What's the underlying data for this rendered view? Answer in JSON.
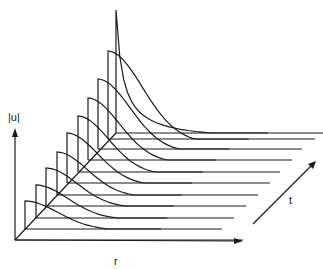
{
  "figure": {
    "type": "waterfall-3d-plot",
    "axes": {
      "vertical_label": "|u|",
      "horizontal_label": "r",
      "depth_label": "t"
    },
    "colors": {
      "line": "#1a1a1a",
      "background": "#ffffff"
    },
    "origin": [
      15,
      240
    ],
    "r_axis_end": [
      243,
      241
    ],
    "u_axis_top": [
      15,
      128
    ],
    "t_arrow": {
      "from": [
        253,
        224
      ],
      "to": [
        316,
        161
      ]
    },
    "slices": [
      {
        "x0": 15,
        "y0": 240,
        "xEnd": 243,
        "height": 0,
        "width": 0
      },
      {
        "x0": 25,
        "y0": 229,
        "xEnd": 222,
        "height": 28,
        "width": 85
      },
      {
        "x0": 36,
        "y0": 218,
        "xEnd": 234,
        "height": 33,
        "width": 82
      },
      {
        "x0": 46,
        "y0": 206,
        "xEnd": 246,
        "height": 38,
        "width": 80
      },
      {
        "x0": 57,
        "y0": 195,
        "xEnd": 258,
        "height": 43,
        "width": 78
      },
      {
        "x0": 67,
        "y0": 183,
        "xEnd": 270,
        "height": 50,
        "width": 78
      },
      {
        "x0": 78,
        "y0": 172,
        "xEnd": 280,
        "height": 56,
        "width": 78
      },
      {
        "x0": 88,
        "y0": 160,
        "xEnd": 292,
        "height": 62,
        "width": 80
      },
      {
        "x0": 98,
        "y0": 149,
        "xEnd": 302,
        "height": 70,
        "width": 82
      },
      {
        "x0": 108,
        "y0": 139,
        "xEnd": 315,
        "height": 88,
        "width": 88
      },
      {
        "x0": 116,
        "y0": 133,
        "xEnd": 323,
        "height": 123,
        "width": 95
      }
    ]
  }
}
